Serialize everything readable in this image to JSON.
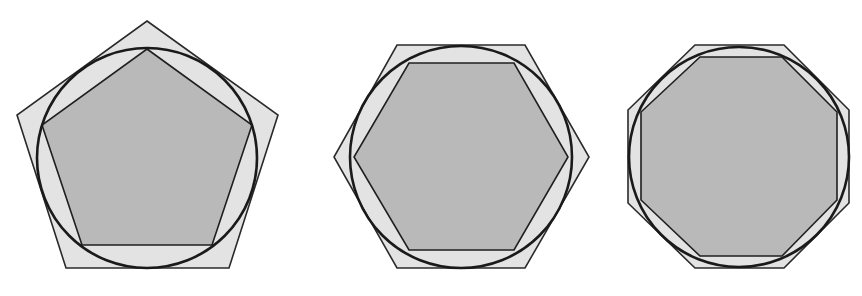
{
  "figure": {
    "colors": {
      "background": "#ffffff",
      "outer_polygon_fill": "#e3e3e3",
      "inner_polygon_fill": "#b9b9b9",
      "stroke": "#1a1a1a"
    },
    "shapes": [
      {
        "name": "pentagon",
        "sides": 5,
        "circle": {
          "cx": 147,
          "cy": 158,
          "r": 110
        },
        "outer_points": "147,21 278,115 229,268 66,268 17,115",
        "inner_points": "147,49 252,125 212,245 82,245 42,125"
      },
      {
        "name": "hexagon",
        "sides": 6,
        "circle": {
          "cx": 461,
          "cy": 157,
          "r": 111
        },
        "outer_points": "397,45 525,45 589,157 525,268 397,268 334,157",
        "inner_points": "409,63 514,63 568,157 514,250 409,250 354,157"
      },
      {
        "name": "octagon",
        "sides": 8,
        "circle": {
          "cx": 739,
          "cy": 157,
          "r": 110
        },
        "outer_points": "695,45 784,45 849,110 849,203 784,268 695,268 628,203 628,110",
        "inner_points": "700,57 782,57 837,112 837,200 782,256 700,256 641,200 641,112"
      }
    ]
  }
}
